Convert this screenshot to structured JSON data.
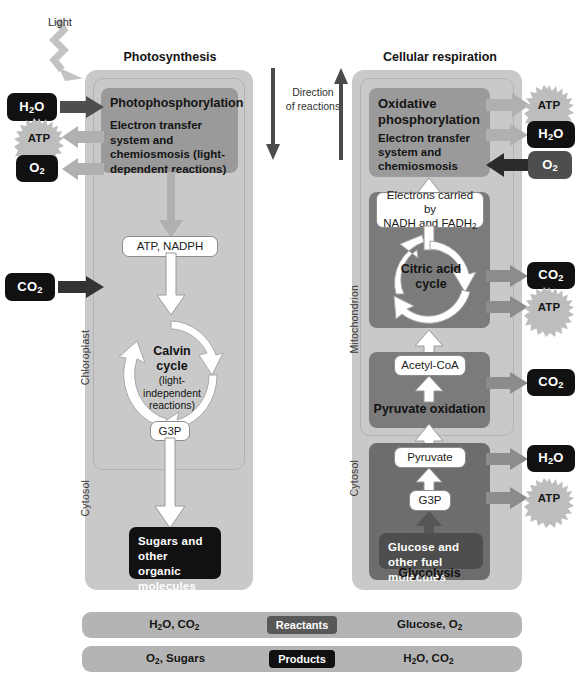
{
  "figure": {
    "light_label": "Light",
    "direction_label_line1": "Direction",
    "direction_label_line2": "of reactions"
  },
  "photosynthesis": {
    "heading": "Photosynthesis",
    "organelle_label": "Chloroplast",
    "cytosol_label": "Cytosol",
    "stage1": {
      "title": "Photophosphorylation",
      "subtitle": "Electron transfer system and chemiosmosis (light-dependent reactions)"
    },
    "carrier_pill": "ATP, NADPH",
    "cycle": {
      "name_line1": "Calvin",
      "name_line2": "cycle",
      "detail_line1": "(light-",
      "detail_line2": "independent",
      "detail_line3": "reactions)"
    },
    "g3p_pill": "G3P",
    "output_box": "Sugars and other organic molecules",
    "inputs": [
      {
        "name": "water-in",
        "label": "H2O",
        "html": "H<sub>2</sub>O",
        "style": "black"
      },
      {
        "name": "carbon-dioxide-in",
        "label": "CO2",
        "html": "CO<sub>2</sub>",
        "style": "black"
      }
    ],
    "outputs": [
      {
        "name": "atp-out",
        "label": "ATP",
        "style": "starburst"
      },
      {
        "name": "oxygen-out",
        "label": "O2",
        "html": "O<sub>2</sub>",
        "style": "black"
      }
    ]
  },
  "cellular_respiration": {
    "heading": "Cellular respiration",
    "organelle_label": "Mitochondrion",
    "cytosol_label": "Cytosol",
    "stage_oxphos": {
      "title_line1": "Oxidative",
      "title_line2": "phosphorylation",
      "subtitle": "Electron transfer system and chemiosmosis"
    },
    "electrons_pill_line1": "Electrons carried by",
    "electrons_pill_line2": "NADH and FADH2",
    "cycle": {
      "name_line1": "Citric acid",
      "name_line2": "cycle"
    },
    "acetyl_pill": "Acetyl-CoA",
    "pyruvate_oxidation_title": "Pyruvate oxidation",
    "pyruvate_pill": "Pyruvate",
    "g3p_pill": "G3P",
    "glucose_box": "Glucose and other fuel molecules",
    "glycolysis_title": "Glycolysis",
    "inputs": [
      {
        "name": "oxygen-in",
        "label": "O2",
        "html": "O<sub>2</sub>",
        "style": "gray"
      }
    ],
    "outputs": [
      {
        "name": "atp-out-oxphos",
        "label": "ATP",
        "style": "starburst"
      },
      {
        "name": "water-out-oxphos",
        "label": "H2O",
        "html": "H<sub>2</sub>O",
        "style": "black"
      },
      {
        "name": "carbon-dioxide-out-citric",
        "label": "CO2",
        "html": "CO<sub>2</sub>",
        "style": "black"
      },
      {
        "name": "atp-out-citric",
        "label": "ATP",
        "style": "starburst"
      },
      {
        "name": "carbon-dioxide-out-pyruvate",
        "label": "CO2",
        "html": "CO<sub>2</sub>",
        "style": "black"
      },
      {
        "name": "water-out-glycolysis",
        "label": "H2O",
        "html": "H<sub>2</sub>O",
        "style": "black"
      },
      {
        "name": "atp-out-glycolysis",
        "label": "ATP",
        "style": "starburst"
      }
    ]
  },
  "legend": {
    "rows": [
      {
        "badge": "Reactants",
        "left_label": "H2O, CO2",
        "left_html": "H<sub>2</sub>O, CO<sub>2</sub>",
        "right_label": "Glucose, O2",
        "right_html": "Glucose, O<sub>2</sub>"
      },
      {
        "badge": "Products",
        "left_label": "O2, Sugars",
        "left_html": "O<sub>2</sub>, Sugars",
        "right_label": "H2O, CO2",
        "right_html": "H<sub>2</sub>O, CO<sub>2</sub>"
      }
    ]
  },
  "colors": {
    "panel": "#c9c9c9",
    "process_block": "#9a9a9a",
    "process_block_dark": "#7b7b7b",
    "molecule_black": "#111111",
    "molecule_gray": "#4e4e4e",
    "legend_bar": "#b4b4b4",
    "arrow_light": "#b0b0b0",
    "arrow_dark": "#4e4e4e",
    "arrow_white": "#ffffff"
  }
}
